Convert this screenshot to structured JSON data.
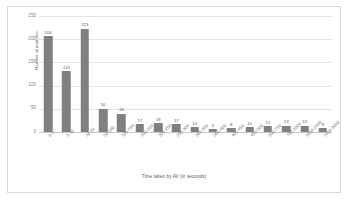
{
  "chart_data": {
    "type": "bar",
    "title": "",
    "subtitle": "",
    "xlabel": "Time taken by AV (in seconds)",
    "ylabel": "Number of modules",
    "ylim": [
      0,
      250
    ],
    "yticks": [
      0,
      50,
      100,
      150,
      200,
      250
    ],
    "grid": true,
    "legend": "none",
    "bar_color": "#808080",
    "categories": [
      "0-5",
      "5-10",
      "10-50",
      "50-100",
      "100-150",
      "150-200",
      "200-250",
      "250-300",
      "300-350",
      "350-400",
      "400-450",
      "450-500",
      "500-750",
      "750-1000",
      "1000-1500",
      "1500-3000"
    ],
    "values": [
      206,
      131,
      223,
      50,
      39,
      17,
      19,
      17,
      10,
      6,
      8,
      10,
      12,
      13,
      13,
      8
    ],
    "data_labels": [
      "206",
      "131",
      "223",
      "50",
      "39",
      "17",
      "19",
      "17",
      "10",
      "6",
      "8",
      "10",
      "12",
      "13",
      "13",
      "8"
    ],
    "ytick_labels": [
      "0",
      "50",
      "100",
      "150",
      "200",
      "250"
    ]
  }
}
